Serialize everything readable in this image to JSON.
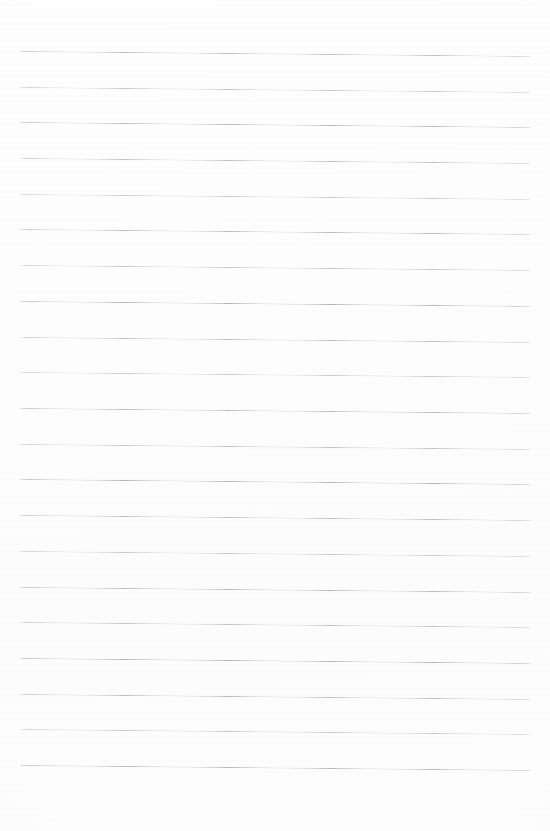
{
  "document": {
    "kind": "scanned-blank-ruled-paper",
    "description": "Blank sheet of lined notebook paper",
    "text_content": "",
    "page_width": 550,
    "page_height": 831,
    "background_color": "#fdfdfd",
    "has_writing": false,
    "has_margin_rule": false,
    "has_holes": false
  },
  "ruling": {
    "line_color": "#969a9e",
    "line_count": 21,
    "line_thickness": 1,
    "first_line_y": 51,
    "line_spacing": 35.7,
    "left_x": 20,
    "right_x": 531,
    "skew_drop_px": 5,
    "lines": [
      {
        "index": 1,
        "y_left": 51,
        "y_right": 56
      },
      {
        "index": 2,
        "y_left": 87,
        "y_right": 92
      },
      {
        "index": 3,
        "y_left": 122,
        "y_right": 127
      },
      {
        "index": 4,
        "y_left": 158,
        "y_right": 163
      },
      {
        "index": 5,
        "y_left": 194,
        "y_right": 199
      },
      {
        "index": 6,
        "y_left": 229,
        "y_right": 234
      },
      {
        "index": 7,
        "y_left": 265,
        "y_right": 270
      },
      {
        "index": 8,
        "y_left": 301,
        "y_right": 306
      },
      {
        "index": 9,
        "y_left": 337,
        "y_right": 342
      },
      {
        "index": 10,
        "y_left": 372,
        "y_right": 377
      },
      {
        "index": 11,
        "y_left": 408,
        "y_right": 413
      },
      {
        "index": 12,
        "y_left": 444,
        "y_right": 449
      },
      {
        "index": 13,
        "y_left": 479,
        "y_right": 484
      },
      {
        "index": 14,
        "y_left": 515,
        "y_right": 520
      },
      {
        "index": 15,
        "y_left": 551,
        "y_right": 556
      },
      {
        "index": 16,
        "y_left": 587,
        "y_right": 592
      },
      {
        "index": 17,
        "y_left": 622,
        "y_right": 627
      },
      {
        "index": 18,
        "y_left": 658,
        "y_right": 663
      },
      {
        "index": 19,
        "y_left": 694,
        "y_right": 699
      },
      {
        "index": 20,
        "y_left": 729,
        "y_right": 734
      },
      {
        "index": 21,
        "y_left": 765,
        "y_right": 770
      }
    ]
  }
}
